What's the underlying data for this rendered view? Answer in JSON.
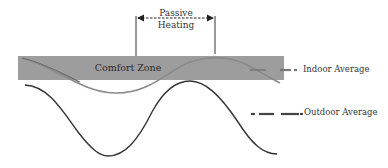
{
  "diagram": {
    "comfort_zone": {
      "label": "Comfort Zone",
      "fill": "#9d9d9d"
    },
    "passive_heating": {
      "line1": "Passive",
      "line2": "Heating"
    },
    "legend": {
      "indoor": {
        "label": "Indoor Average",
        "color": "#8a8a8a"
      },
      "outdoor": {
        "label": "Outdoor Average",
        "color": "#333333"
      }
    }
  }
}
